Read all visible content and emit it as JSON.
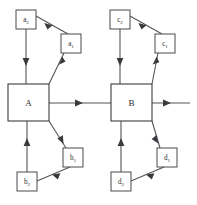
{
  "diagram": {
    "type": "block-diagram",
    "title": "",
    "main_blocks": [
      {
        "id": "A",
        "label": "A",
        "x": 8,
        "y": 84,
        "w": 41,
        "h": 37
      },
      {
        "id": "B",
        "label": "B",
        "x": 111,
        "y": 84,
        "w": 41,
        "h": 37
      }
    ],
    "small_nodes": [
      {
        "id": "a2",
        "base": "a",
        "subscript": "2",
        "x": 16,
        "y": 10,
        "w": 20,
        "h": 19
      },
      {
        "id": "a1",
        "base": "a",
        "subscript": "1",
        "x": 61,
        "y": 34,
        "w": 20,
        "h": 19
      },
      {
        "id": "b1",
        "base": "b",
        "subscript": "1",
        "x": 63,
        "y": 148,
        "w": 20,
        "h": 19
      },
      {
        "id": "b2",
        "base": "b",
        "subscript": "2",
        "x": 17,
        "y": 172,
        "w": 20,
        "h": 19
      },
      {
        "id": "c2",
        "base": "c",
        "subscript": "2",
        "x": 110,
        "y": 10,
        "w": 20,
        "h": 19
      },
      {
        "id": "c1",
        "base": "c",
        "subscript": "1",
        "x": 155,
        "y": 34,
        "w": 20,
        "h": 19
      },
      {
        "id": "d1",
        "base": "d",
        "subscript": "1",
        "x": 157,
        "y": 148,
        "w": 20,
        "h": 19
      },
      {
        "id": "d2",
        "base": "d",
        "subscript": "2",
        "x": 111,
        "y": 172,
        "w": 20,
        "h": 19
      }
    ],
    "edges": [
      {
        "id": "A-to-B",
        "from": "A",
        "to": "B",
        "direction": "right"
      },
      {
        "id": "B-to-output",
        "from": "B",
        "to": "output",
        "direction": "right"
      },
      {
        "id": "A-to-a1",
        "from": "A",
        "to": "a1",
        "direction": "up-right"
      },
      {
        "id": "a1-to-a2",
        "from": "a1",
        "to": "a2",
        "direction": "up-left"
      },
      {
        "id": "a2-to-A",
        "from": "a2",
        "to": "A",
        "direction": "down"
      },
      {
        "id": "A-to-b1",
        "from": "A",
        "to": "b1",
        "direction": "down-right"
      },
      {
        "id": "b1-to-b2",
        "from": "b1",
        "to": "b2",
        "direction": "down-left"
      },
      {
        "id": "b2-to-A",
        "from": "b2",
        "to": "A",
        "direction": "up"
      },
      {
        "id": "B-to-c1",
        "from": "B",
        "to": "c1",
        "direction": "up-right"
      },
      {
        "id": "c1-to-c2",
        "from": "c1",
        "to": "c2",
        "direction": "up-left"
      },
      {
        "id": "c2-to-B",
        "from": "c2",
        "to": "B",
        "direction": "down"
      },
      {
        "id": "B-to-d1",
        "from": "B",
        "to": "d1",
        "direction": "down-right"
      },
      {
        "id": "d1-to-d2",
        "from": "d1",
        "to": "d2",
        "direction": "down-left"
      },
      {
        "id": "d2-to-B",
        "from": "d2",
        "to": "B",
        "direction": "up"
      }
    ],
    "colors": {
      "line": "#55555a",
      "box_stroke": "#4a4a4a",
      "arrow_fill": "#3a3a3e",
      "text": "#2b2b2b",
      "background": "#ffffff"
    }
  }
}
